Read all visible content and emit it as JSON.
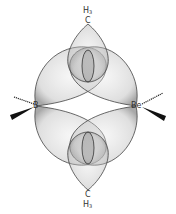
{
  "diagram": {
    "title": "",
    "type": "three-center two-electron bridging orbital diagram",
    "atoms": {
      "top_bridge": {
        "element": "C",
        "hydrogens": "H",
        "h_count": "3"
      },
      "bottom_bridge": {
        "element": "C",
        "hydrogens": "H",
        "h_count": "3"
      },
      "left_center": {
        "element": "B"
      },
      "right_center": {
        "element": "Be"
      }
    },
    "colors": {
      "lobe_fill": "#b4b4b4",
      "lobe_stroke": "#3c3c3c",
      "bond": "#111111",
      "background": "#ffffff"
    }
  }
}
